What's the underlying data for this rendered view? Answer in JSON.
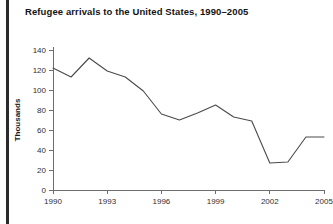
{
  "title": "Refugee arrivals to the United States, 1990–2005",
  "axis": {
    "ylabel": "Thousands",
    "ytick_labels": [
      "0",
      "20",
      "40",
      "60",
      "80",
      "100",
      "120",
      "140"
    ],
    "xtick_labels": [
      "1990",
      "1993",
      "1996",
      "1999",
      "2002",
      "2005"
    ]
  },
  "colors": {
    "line": "#4a4a4a",
    "axis": "#6e6e6e",
    "text": "#2f2f2f",
    "title": "#141414",
    "rule": "#2b2b2b",
    "background": "#ffffff"
  },
  "chart_data": {
    "type": "line",
    "title": "Refugee arrivals to the United States, 1990–2005",
    "xlabel": "",
    "ylabel": "Thousands",
    "x": [
      1990,
      1991,
      1992,
      1993,
      1994,
      1995,
      1996,
      1997,
      1998,
      1999,
      2000,
      2001,
      2002,
      2003,
      2004,
      2005
    ],
    "values": [
      122,
      113,
      132,
      119,
      113,
      99,
      76,
      70,
      77,
      85,
      73,
      69,
      27,
      28,
      53,
      53
    ],
    "xlim": [
      1990,
      2005
    ],
    "ylim": [
      0,
      140
    ],
    "yticks": [
      0,
      20,
      40,
      60,
      80,
      100,
      120,
      140
    ],
    "xticks": [
      1990,
      1993,
      1996,
      1999,
      2002,
      2005
    ],
    "grid": false,
    "legend": false,
    "units": "thousands of people"
  }
}
